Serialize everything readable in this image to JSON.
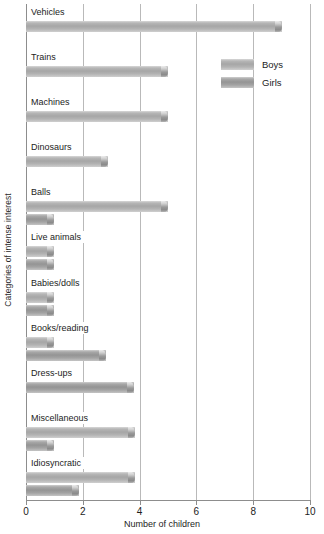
{
  "chart_data": {
    "type": "bar",
    "orientation": "horizontal",
    "title": "",
    "xlabel": "Number of children",
    "ylabel": "Categories of intense interest",
    "xlim": [
      0,
      10
    ],
    "xticks": [
      0,
      2,
      4,
      6,
      8,
      10
    ],
    "xtick_labels": [
      "0",
      "2",
      "4",
      "6",
      "8",
      "10"
    ],
    "grid": true,
    "grid_axis": "x",
    "legend_position": "upper right",
    "categories": [
      "Vehicles",
      "Trains",
      "Machines",
      "Dinosaurs",
      "Balls",
      "Live animals",
      "Babies/dolls",
      "Books/reading",
      "Dress-ups",
      "Miscellaneous",
      "Idiosyncratic"
    ],
    "series": [
      {
        "name": "Boys",
        "color": "#a6a6a6",
        "values": [
          9.0,
          5.0,
          5.0,
          2.9,
          5.0,
          1.0,
          1.0,
          1.0,
          0,
          3.85,
          3.85
        ]
      },
      {
        "name": "Girls",
        "color": "#949494",
        "values": [
          0,
          0,
          0,
          0,
          1.0,
          1.0,
          1.0,
          2.8,
          3.8,
          1.0,
          1.85
        ]
      }
    ]
  },
  "legend": {
    "items": [
      {
        "label": "Boys",
        "key": "boys"
      },
      {
        "label": "Girls",
        "key": "girls"
      }
    ]
  },
  "axes": {
    "x_title": "Number of children",
    "y_title": "Categories of intense interest"
  }
}
